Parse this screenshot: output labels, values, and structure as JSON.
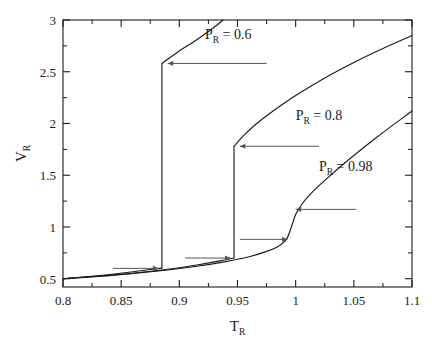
{
  "chart_data": {
    "type": "line",
    "title": "",
    "xlabel": "T_R",
    "ylabel": "V_R",
    "xlim": [
      0.8,
      1.1
    ],
    "ylim": [
      0.42,
      3.0
    ],
    "grid": false,
    "legend": "inline-annotations",
    "xticks": [
      "0.8",
      "0.85",
      "0.9",
      "0.95",
      "1",
      "1.05",
      "1.1"
    ],
    "xtick_values": [
      0.8,
      0.85,
      0.9,
      0.95,
      1.0,
      1.05,
      1.1
    ],
    "xminor_count": 1,
    "yticks": [
      "0.5",
      "1",
      "1.5",
      "2",
      "2.5",
      "3"
    ],
    "ytick_values": [
      0.5,
      1.0,
      1.5,
      2.0,
      2.5,
      3.0
    ],
    "yminor_count": 1,
    "series": [
      {
        "name": "P_R = 0.6",
        "label": "P",
        "label_sub": "R",
        "label_eq": "= 0.6",
        "pressure": 0.6,
        "discontinuity": {
          "x": 0.885,
          "y_low": 0.6,
          "y_high": 2.58
        },
        "branch_lower": {
          "x": [
            0.8,
            0.82,
            0.84,
            0.855,
            0.87,
            0.88,
            0.885
          ],
          "y": [
            0.5,
            0.519,
            0.541,
            0.56,
            0.582,
            0.595,
            0.602
          ]
        },
        "branch_upper": {
          "x": [
            0.885,
            0.9,
            0.915,
            0.93,
            0.9375
          ],
          "y": [
            2.58,
            2.7,
            2.81,
            2.93,
            3.0
          ]
        },
        "exits_top_at_x": 0.9375
      },
      {
        "name": "P_R = 0.8",
        "label": "P",
        "label_sub": "R",
        "label_eq": "= 0.8",
        "pressure": 0.8,
        "discontinuity": {
          "x": 0.947,
          "y_low": 0.7,
          "y_high": 1.78
        },
        "branch_lower": {
          "x": [
            0.8,
            0.83,
            0.86,
            0.89,
            0.915,
            0.935,
            0.947
          ],
          "y": [
            0.5,
            0.524,
            0.553,
            0.592,
            0.633,
            0.672,
            0.7
          ]
        },
        "branch_upper": {
          "x": [
            0.947,
            0.955,
            0.965,
            0.98,
            1.0,
            1.025,
            1.05,
            1.075,
            1.1
          ],
          "y": [
            1.78,
            1.88,
            1.985,
            2.115,
            2.27,
            2.44,
            2.59,
            2.725,
            2.85
          ]
        }
      },
      {
        "name": "P_R = 0.98",
        "label": "P",
        "label_sub": "R",
        "label_eq": "= 0.98",
        "pressure": 0.98,
        "discontinuity": null,
        "branch": {
          "x": [
            0.8,
            0.84,
            0.88,
            0.915,
            0.94,
            0.96,
            0.975,
            0.985,
            0.992,
            0.996,
            1.0,
            1.005,
            1.012,
            1.025,
            1.045,
            1.07,
            1.1
          ],
          "y": [
            0.5,
            0.53,
            0.573,
            0.62,
            0.665,
            0.712,
            0.764,
            0.812,
            0.88,
            0.99,
            1.12,
            1.215,
            1.31,
            1.45,
            1.645,
            1.87,
            2.12
          ]
        }
      }
    ],
    "annotations": [
      {
        "name": "arrow-upper-06",
        "text": "",
        "direction": "left",
        "tail_x": 0.975,
        "head_x": 0.89,
        "y": 2.58
      },
      {
        "name": "arrow-lower-06",
        "text": "",
        "direction": "right",
        "tail_x": 0.843,
        "head_x": 0.882,
        "y": 0.6
      },
      {
        "name": "arrow-upper-08",
        "text": "",
        "direction": "left",
        "tail_x": 1.02,
        "head_x": 0.952,
        "y": 1.78
      },
      {
        "name": "arrow-lower-08",
        "text": "",
        "direction": "right",
        "tail_x": 0.905,
        "head_x": 0.944,
        "y": 0.7
      },
      {
        "name": "arrow-upper-098",
        "text": "",
        "direction": "left",
        "tail_x": 1.052,
        "head_x": 1.0,
        "y": 1.17
      },
      {
        "name": "arrow-lower-098",
        "text": "",
        "direction": "right",
        "tail_x": 0.952,
        "head_x": 0.993,
        "y": 0.88
      }
    ],
    "label_positions": [
      {
        "series": "P_R = 0.6",
        "x": 0.922,
        "y": 2.815
      },
      {
        "series": "P_R = 0.8",
        "x": 1.0,
        "y": 2.03
      },
      {
        "series": "P_R = 0.98",
        "x": 1.02,
        "y": 1.54
      }
    ]
  },
  "axes": {
    "x_title": "T",
    "x_title_sub": "R",
    "y_title": "V",
    "y_title_sub": "R"
  },
  "colors": {
    "line": "#1a1a1a",
    "axis": "#1a1a1a",
    "background": "#ffffff",
    "arrow": "#555555"
  }
}
